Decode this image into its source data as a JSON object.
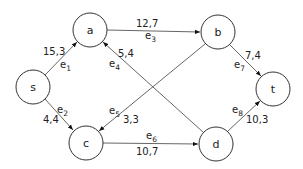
{
  "diagram": {
    "type": "directed flow network",
    "nodes": [
      {
        "id": "s",
        "label": "s",
        "x": 33,
        "y": 87
      },
      {
        "id": "a",
        "label": "a",
        "x": 90,
        "y": 30
      },
      {
        "id": "b",
        "label": "b",
        "x": 218,
        "y": 32
      },
      {
        "id": "c",
        "label": "c",
        "x": 86,
        "y": 143
      },
      {
        "id": "d",
        "label": "d",
        "x": 216,
        "y": 144
      },
      {
        "id": "t",
        "label": "t",
        "x": 273,
        "y": 89
      }
    ],
    "edges": [
      {
        "id": "e1",
        "name": "e",
        "sub": "1",
        "from": "s",
        "to": "a",
        "value": "15,3"
      },
      {
        "id": "e2",
        "name": "e",
        "sub": "2",
        "from": "s",
        "to": "c",
        "value": "4,4"
      },
      {
        "id": "e3",
        "name": "e",
        "sub": "3",
        "from": "a",
        "to": "b",
        "value": "12,7"
      },
      {
        "id": "e4",
        "name": "e",
        "sub": "4",
        "from": "d",
        "to": "a",
        "value": "5,4"
      },
      {
        "id": "e5",
        "name": "e",
        "sub": "5",
        "from": "b",
        "to": "c",
        "value": "3,3"
      },
      {
        "id": "e6",
        "name": "e",
        "sub": "6",
        "from": "c",
        "to": "d",
        "value": "10,7"
      },
      {
        "id": "e7",
        "name": "e",
        "sub": "7",
        "from": "b",
        "to": "t",
        "value": "7,4"
      },
      {
        "id": "e8",
        "name": "e",
        "sub": "8",
        "from": "d",
        "to": "t",
        "value": "10,3"
      }
    ]
  }
}
